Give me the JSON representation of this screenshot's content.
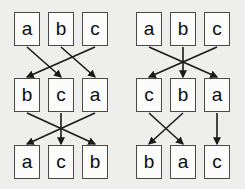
{
  "figure": {
    "title": "",
    "background_color": "#eeeeec",
    "box_fill_color": "#fbfbfa",
    "box_border_color": "#4a4a4a",
    "arrow_color": "#1a1a1a",
    "text_color": "#0d0d0d"
  },
  "diagrams": [
    {
      "id": "left",
      "name": "left-permutation-diagram",
      "rows": [
        {
          "id": "row-1",
          "labels": [
            "a",
            "b",
            "c"
          ]
        },
        {
          "id": "row-2",
          "labels": [
            "b",
            "c",
            "a"
          ]
        },
        {
          "id": "row-3",
          "labels": [
            "a",
            "c",
            "b"
          ]
        }
      ],
      "edges": [
        {
          "from_row": 1,
          "from_pos": 1,
          "to_row": 2,
          "to_pos": 2
        },
        {
          "from_row": 1,
          "from_pos": 2,
          "to_row": 2,
          "to_pos": 3
        },
        {
          "from_row": 1,
          "from_pos": 3,
          "to_row": 2,
          "to_pos": 1
        },
        {
          "from_row": 2,
          "from_pos": 1,
          "to_row": 3,
          "to_pos": 3
        },
        {
          "from_row": 2,
          "from_pos": 2,
          "to_row": 3,
          "to_pos": 2
        },
        {
          "from_row": 2,
          "from_pos": 3,
          "to_row": 3,
          "to_pos": 1
        }
      ]
    },
    {
      "id": "right",
      "name": "right-permutation-diagram",
      "rows": [
        {
          "id": "row-1",
          "labels": [
            "a",
            "b",
            "c"
          ]
        },
        {
          "id": "row-2",
          "labels": [
            "c",
            "b",
            "a"
          ]
        },
        {
          "id": "row-3",
          "labels": [
            "b",
            "a",
            "c"
          ]
        }
      ],
      "edges": [
        {
          "from_row": 1,
          "from_pos": 1,
          "to_row": 2,
          "to_pos": 3
        },
        {
          "from_row": 1,
          "from_pos": 2,
          "to_row": 2,
          "to_pos": 2
        },
        {
          "from_row": 1,
          "from_pos": 3,
          "to_row": 2,
          "to_pos": 1
        },
        {
          "from_row": 2,
          "from_pos": 1,
          "to_row": 3,
          "to_pos": 2
        },
        {
          "from_row": 2,
          "from_pos": 2,
          "to_row": 3,
          "to_pos": 1
        },
        {
          "from_row": 2,
          "from_pos": 3,
          "to_row": 3,
          "to_pos": 3
        }
      ]
    }
  ],
  "geometry": {
    "column_x": [
      14,
      48,
      82
    ],
    "row_y": [
      12,
      78,
      145
    ],
    "box_width": 26,
    "box_height": 34
  }
}
